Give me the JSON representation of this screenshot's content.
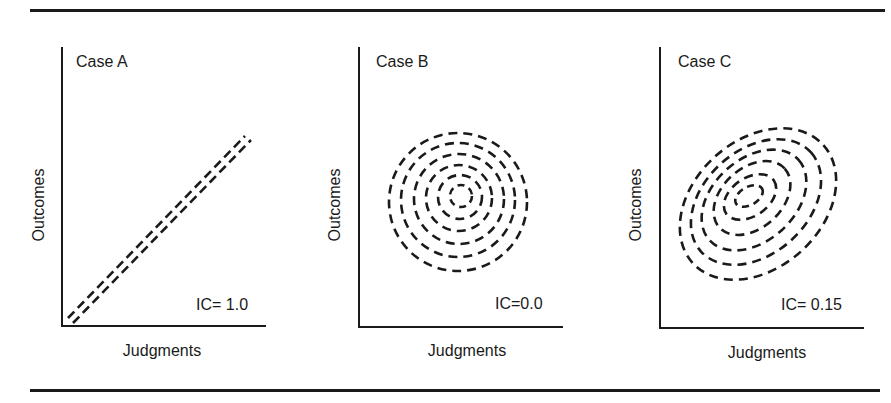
{
  "figure": {
    "panels": [
      {
        "title": "Case A",
        "ic_label": "IC= 1.0",
        "xlabel": "Judgments",
        "ylabel": "Outcomes",
        "shape": "two parallel dashed diagonal lines"
      },
      {
        "title": "Case B",
        "ic_label": "IC=0.0",
        "xlabel": "Judgments",
        "ylabel": "Outcomes",
        "shape": "concentric dashed circles"
      },
      {
        "title": "Case C",
        "ic_label": "IC= 0.15",
        "xlabel": "Judgments",
        "ylabel": "Outcomes",
        "shape": "concentric dashed tilted ellipses"
      }
    ]
  }
}
